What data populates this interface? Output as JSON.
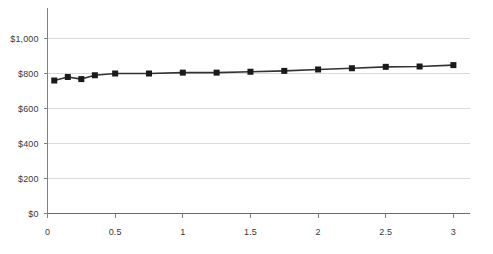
{
  "chart_data": {
    "type": "line",
    "title": "",
    "subtitle": "",
    "xlabel": "",
    "ylabel": "",
    "xlim": [
      0,
      3.22
    ],
    "ylim": [
      0,
      1075
    ],
    "grid": true,
    "legend": false,
    "legend_position": "none",
    "marker": "square",
    "line_color": "#333333",
    "marker_color": "#1a1a1a",
    "grid_color": "#d9d9d9",
    "axis_color": "#808080",
    "y_ticks": [
      0,
      200,
      400,
      600,
      800,
      1000
    ],
    "y_tick_labels": [
      "$0",
      "$200",
      "$400",
      "$600",
      "$800",
      "$1,000"
    ],
    "x_ticks": [
      0,
      0.5,
      1,
      1.5,
      2,
      2.5,
      3
    ],
    "x_tick_labels": [
      "0",
      "0.5",
      "1",
      "1.5",
      "2",
      "2.5",
      "3"
    ],
    "series": [
      {
        "name": "",
        "x": [
          0.05,
          0.15,
          0.25,
          0.35,
          0.5,
          0.75,
          1.0,
          1.25,
          1.5,
          1.75,
          2.0,
          2.25,
          2.5,
          2.75,
          3.0
        ],
        "values": [
          760,
          780,
          768,
          790,
          800,
          800,
          805,
          805,
          810,
          815,
          823,
          830,
          838,
          840,
          848
        ]
      }
    ]
  }
}
